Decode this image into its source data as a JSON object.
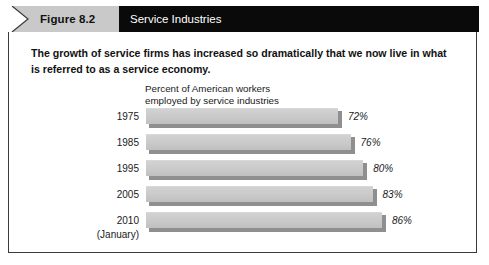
{
  "header": {
    "figure_label": "Figure 8.2",
    "title": "Service Industries",
    "notch_icon": "chevron-right-icon",
    "gray_color": "#c9c9c9",
    "black_color": "#0a0a0a"
  },
  "body": {
    "lede": "The growth of service firms has increased so dramatically that we now live in what is referred to as a service economy."
  },
  "chart_data": {
    "type": "bar",
    "orientation": "horizontal",
    "title": "Percent of American workers\nemployed by service industries",
    "xlabel": "",
    "ylabel": "",
    "categories": [
      "1975",
      "1985",
      "1995",
      "2005",
      "2010"
    ],
    "category_sublabels": [
      "",
      "",
      "",
      "",
      "(January)"
    ],
    "values": [
      72,
      76,
      80,
      83,
      86
    ],
    "value_labels": [
      "72%",
      "76%",
      "80%",
      "83%",
      "86%"
    ],
    "xlim": [
      0,
      100
    ],
    "grid": false,
    "legend": false,
    "bar_color": "#cacaca",
    "bar_shadow_color": "#8f8f8f"
  }
}
